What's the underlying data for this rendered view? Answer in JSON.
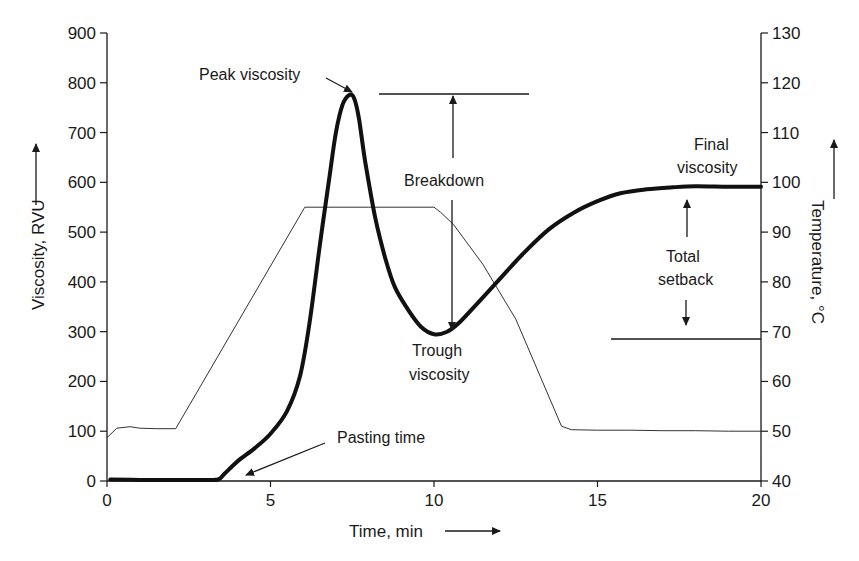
{
  "chart_data": {
    "type": "line",
    "title": "",
    "xlabel": "Time, min",
    "ylabel": "Viscosity, RVU",
    "ylabel_right": "Temperature, °C",
    "xlim": [
      0,
      20
    ],
    "ylim": [
      0,
      900
    ],
    "ylim_right": [
      40,
      130
    ],
    "x_ticks": [
      0,
      5,
      10,
      15,
      20
    ],
    "y_ticks": [
      0,
      100,
      200,
      300,
      400,
      500,
      600,
      700,
      800,
      900
    ],
    "y_ticks_right": [
      40,
      50,
      60,
      70,
      80,
      90,
      100,
      110,
      120,
      130
    ],
    "grid": false,
    "legend": null,
    "series": [
      {
        "name": "Viscosity",
        "axis": "left",
        "style": "thick",
        "x": [
          0.1,
          1,
          2,
          3,
          3.4,
          3.6,
          4,
          4.5,
          5,
          5.5,
          5.9,
          6.2,
          6.5,
          6.8,
          7.0,
          7.2,
          7.4,
          7.55,
          7.7,
          7.9,
          8.2,
          8.5,
          8.8,
          9.2,
          9.6,
          10.0,
          10.4,
          10.8,
          11.3,
          12.0,
          12.7,
          13.5,
          14.3,
          15.0,
          15.7,
          16.5,
          17.3,
          18.0,
          19.0,
          20.0
        ],
        "y": [
          3,
          2,
          2,
          2,
          3,
          15,
          40,
          65,
          95,
          140,
          210,
          320,
          470,
          610,
          700,
          755,
          775,
          770,
          730,
          640,
          530,
          450,
          390,
          345,
          310,
          295,
          300,
          320,
          355,
          405,
          455,
          505,
          540,
          562,
          578,
          586,
          590,
          592,
          591,
          591
        ]
      },
      {
        "name": "Temperature",
        "axis": "right",
        "style": "thin",
        "x": [
          0,
          0.3,
          0.7,
          1,
          1.5,
          2.1,
          6.05,
          8,
          10.0,
          10.2,
          10.6,
          11.5,
          12.5,
          13.9,
          14.2,
          15,
          16,
          17,
          18,
          19,
          20
        ],
        "y": [
          48.7,
          50.6,
          50.9,
          50.6,
          50.5,
          50.5,
          95,
          95,
          95,
          94,
          91.5,
          83.5,
          72.5,
          51,
          50.3,
          50.2,
          50.2,
          50.1,
          50.1,
          50.0,
          50.0
        ]
      }
    ],
    "annotations": [
      {
        "text": "Peak viscosity",
        "target_x": 7.45,
        "target_y": 775
      },
      {
        "text": "Breakdown",
        "from_y": 775,
        "to_y": 295,
        "x": 10.4
      },
      {
        "text": "Trough viscosity",
        "target_x": 10.4,
        "target_y": 295
      },
      {
        "text": "Final viscosity",
        "target_x": 18.4,
        "target_y": 591
      },
      {
        "text": "Total setback",
        "from_y": 591,
        "to_y": 295,
        "x": 17.8
      },
      {
        "text": "Pasting time",
        "target_x": 3.9,
        "target_y": 0
      }
    ]
  },
  "labels": {
    "xlabel": "Time, min",
    "ylabel": "Viscosity, RVU",
    "ylabel_right": "Temperature, °C",
    "peak": "Peak viscosity",
    "breakdown": "Breakdown",
    "trough_line1": "Trough",
    "trough_line2": "viscosity",
    "final_line1": "Final",
    "final_line2": "viscosity",
    "setback_line1": "Total",
    "setback_line2": "setback",
    "pasting": "Pasting time"
  },
  "colors": {
    "ink": "#1a1a1a",
    "background": "#ffffff"
  }
}
